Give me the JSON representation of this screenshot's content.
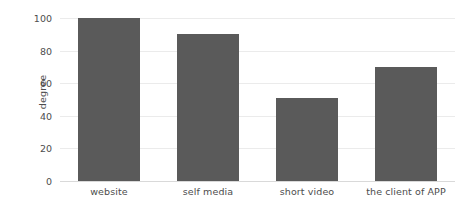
{
  "chart_data": {
    "type": "bar",
    "title": "",
    "subtitle": "",
    "xlabel": "",
    "ylabel": "degree",
    "categories": [
      "website",
      "self media",
      "short video",
      "the client of APP"
    ],
    "values": [
      100,
      90,
      51,
      70
    ],
    "series": [
      {
        "name": "degree",
        "values": [
          100,
          90,
          51,
          70
        ],
        "color": "#5a5a5a"
      }
    ],
    "ylim": [
      0,
      100
    ],
    "y_ticks": [
      0,
      20,
      40,
      60,
      80,
      100
    ],
    "y_tick_labels": [
      "0",
      "20",
      "40",
      "60",
      "80",
      "100"
    ],
    "grid": true,
    "grid_axis": "y",
    "legend": false,
    "legend_position": "none",
    "annotations": []
  },
  "style": {
    "bar_color": "#5a5a5a",
    "grid_color": "#ebebeb",
    "axis_color": "#d9d9d9",
    "text_color": "#4d4d4d",
    "background": "#ffffff"
  }
}
